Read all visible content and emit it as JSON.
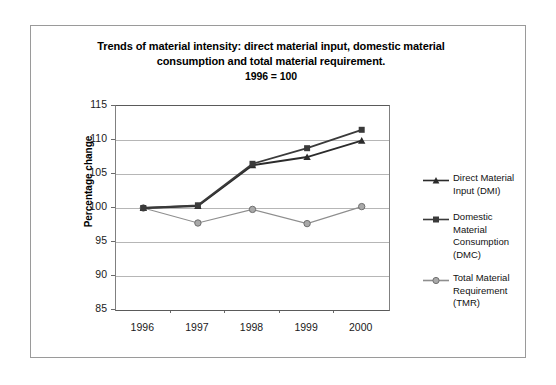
{
  "chart_data": {
    "type": "line",
    "title": "Trends of material intensity: direct material input, domestic material consumption and total material requirement.",
    "subtitle": "1996 = 100",
    "title_line1": "Trends of material intensity: direct material input, domestic material",
    "title_line2": "consumption and total material requirement.",
    "title_line3": "1996 = 100",
    "xlabel": "",
    "ylabel": "Percentage change",
    "categories": [
      "1996",
      "1997",
      "1998",
      "1999",
      "2000"
    ],
    "ylim": [
      85,
      115
    ],
    "yticks": [
      "115",
      "110",
      "105",
      "100",
      "95",
      "90",
      "85"
    ],
    "ytick_values": [
      115,
      110,
      105,
      100,
      95,
      90,
      85
    ],
    "grid": true,
    "legend_position": "right",
    "series": [
      {
        "name": "Direct Material Input (DMI)",
        "label_line1": "Direct Material",
        "label_line2": "Input (DMI)",
        "marker": "triangle",
        "color": "#2b2b2b",
        "values": [
          100.0,
          100.3,
          106.3,
          107.5,
          109.9
        ]
      },
      {
        "name": "Domestic Material Consumption (DMC)",
        "label_line1": "Domestic Material",
        "label_line2": "Consumption",
        "label_line3": "(DMC)",
        "marker": "square",
        "color": "#3a3a3a",
        "values": [
          100.0,
          100.4,
          106.5,
          108.8,
          111.5
        ]
      },
      {
        "name": "Total Material Requirement (TMR)",
        "label_line1": "Total Material",
        "label_line2": "Requirement",
        "label_line3": "(TMR)",
        "marker": "circle",
        "color": "#8e8e8e",
        "values": [
          100.0,
          97.8,
          99.8,
          97.7,
          100.2
        ]
      }
    ]
  }
}
